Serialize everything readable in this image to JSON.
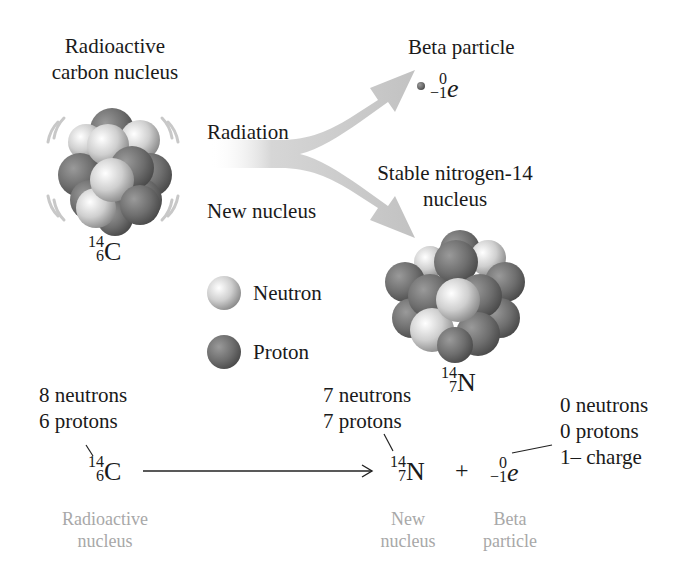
{
  "diagram": {
    "title_left": [
      "Radioactive",
      "carbon nucleus"
    ],
    "arrow_labels": {
      "upper": "Radiation",
      "lower": "New nucleus"
    },
    "beta": {
      "title": "Beta particle",
      "mass": "0",
      "charge": "−1",
      "symbol": "e"
    },
    "nitrogen": {
      "title": [
        "Stable nitrogen-14",
        "nucleus"
      ],
      "mass": "14",
      "atomic": "7",
      "symbol": "N"
    },
    "carbon": {
      "mass": "14",
      "atomic": "6",
      "symbol": "C"
    },
    "legend": [
      {
        "label": "Neutron",
        "color": "#d8d8d8"
      },
      {
        "label": "Proton",
        "color": "#7a7a7a"
      }
    ]
  },
  "equation": {
    "reactant": {
      "mass": "14",
      "atomic": "6",
      "symbol": "C",
      "note": [
        "8 neutrons",
        "6 protons"
      ],
      "caption": [
        "Radioactive",
        "nucleus"
      ]
    },
    "product1": {
      "mass": "14",
      "atomic": "7",
      "symbol": "N",
      "note": [
        "7 neutrons",
        "7 protons"
      ],
      "caption": [
        "New",
        "nucleus"
      ]
    },
    "plus": "+",
    "product2": {
      "mass": "0",
      "atomic": "−1",
      "symbol": "e",
      "note": [
        "0 neutrons",
        "0 protons",
        "1– charge"
      ],
      "caption": [
        "Beta",
        "particle"
      ]
    }
  },
  "colors": {
    "arrow": "#c4c4c4",
    "caption": "#a8a8a8",
    "text": "#1a1a1a"
  }
}
